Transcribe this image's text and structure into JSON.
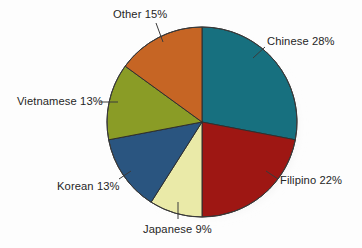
{
  "chart_data": {
    "type": "pie",
    "title": "",
    "subtitle": "",
    "xlabel": "",
    "ylabel": "",
    "legend_position": "none",
    "grid": false,
    "labels_inline": true,
    "categories": [
      "Chinese",
      "Filipino",
      "Japanese",
      "Korean",
      "Vietnamese",
      "Other"
    ],
    "values": [
      28,
      22,
      9,
      13,
      13,
      15
    ],
    "unit": "%",
    "total": 100,
    "start_angle_deg": 0,
    "direction": "clockwise",
    "slices": [
      {
        "name": "Chinese",
        "value": 28,
        "label": "Chinese 28%",
        "color": "#17707f",
        "start_deg": 0.0,
        "end_deg": 100.8
      },
      {
        "name": "Filipino",
        "value": 22,
        "label": "Filipino 22%",
        "color": "#9e1713",
        "start_deg": 100.8,
        "end_deg": 180.0
      },
      {
        "name": "Japanese",
        "value": 9,
        "label": "Japanese 9%",
        "color": "#eaeaa8",
        "start_deg": 180.0,
        "end_deg": 212.4
      },
      {
        "name": "Korean",
        "value": 13,
        "label": "Korean 13%",
        "color": "#2a5580",
        "start_deg": 212.4,
        "end_deg": 259.2
      },
      {
        "name": "Vietnamese",
        "value": 13,
        "label": "Vietnamese 13%",
        "color": "#8a9c26",
        "start_deg": 259.2,
        "end_deg": 306.0
      },
      {
        "name": "Other",
        "value": 15,
        "label": "Other 15%",
        "color": "#c66524",
        "start_deg": 306.0,
        "end_deg": 360.0
      }
    ]
  },
  "labels": {
    "chinese": "Chinese 28%",
    "filipino": "Filipino 22%",
    "japanese": "Japanese 9%",
    "korean": "Korean 13%",
    "vietnamese": "Vietnamese 13%",
    "other": "Other 15%"
  },
  "colors": {
    "background": "#fdfdfd",
    "text": "#262626",
    "leader_line": "#3a3a3a",
    "slice_outline": "#2f2f2f",
    "chinese": "#17707f",
    "filipino": "#9e1713",
    "japanese": "#eaeaa8",
    "korean": "#2a5580",
    "vietnamese": "#8a9c26",
    "other": "#c66524"
  }
}
